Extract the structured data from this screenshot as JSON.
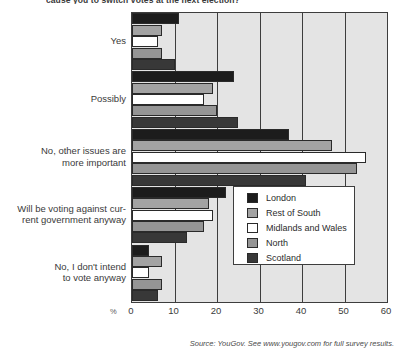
{
  "chart_data": {
    "type": "bar",
    "orientation": "horizontal",
    "title": "cause you to switch votes at the next election?",
    "xlabel": "%",
    "ylabel": "",
    "xlim": [
      0,
      60
    ],
    "xticks": [
      0,
      10,
      20,
      30,
      40,
      50,
      60
    ],
    "grid": true,
    "legend_position": "center-right",
    "categories": [
      "Yes",
      "Possibly",
      "No, other issues are more important",
      "Will be voting against current government anyway",
      "No, I don't intend to vote anyway"
    ],
    "category_lines": [
      [
        "Yes"
      ],
      [
        "Possibly"
      ],
      [
        "No, other issues are",
        "more important"
      ],
      [
        "Will be voting against cur-",
        "rent government anyway"
      ],
      [
        "No, I don't intend",
        "to vote anyway"
      ]
    ],
    "series": [
      {
        "name": "London",
        "color": "#1c1c1c",
        "values": [
          11,
          24,
          37,
          22,
          4
        ]
      },
      {
        "name": "Rest of South",
        "color": "#a3a3a3",
        "values": [
          7,
          19,
          47,
          18,
          7
        ]
      },
      {
        "name": "Midlands and Wales",
        "color": "#ffffff",
        "values": [
          6,
          17,
          55,
          19,
          4
        ]
      },
      {
        "name": "North",
        "color": "#959595",
        "values": [
          7,
          20,
          53,
          17,
          7
        ]
      },
      {
        "name": "Scotland",
        "color": "#383838",
        "values": [
          10,
          25,
          41,
          13,
          6
        ]
      }
    ],
    "source": "Source: YouGov. See www.yougov.com for full survey results."
  }
}
